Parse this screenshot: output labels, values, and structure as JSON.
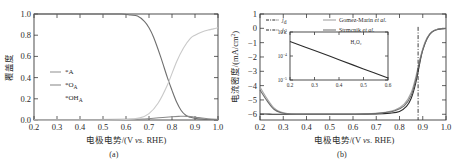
{
  "figure": {
    "panel_a_caption": "(a)",
    "panel_b_caption": "(b)"
  },
  "chart_data": [
    {
      "id": "panel_a",
      "type": "line",
      "title": "",
      "xlabel": "电极电势/(V vs. RHE)",
      "ylabel": "覆盖度",
      "xlim": [
        0.2,
        1.0
      ],
      "ylim": [
        0.0,
        1.0
      ],
      "xticks": [
        "0.2",
        "0.3",
        "0.4",
        "0.5",
        "0.6",
        "0.7",
        "0.8",
        "0.9",
        "1.0"
      ],
      "yticks": [
        "0.0",
        "0.2",
        "0.4",
        "0.6",
        "0.8",
        "1.0"
      ],
      "grid": false,
      "legend_position": "center-left",
      "legend": [
        {
          "label": "*A",
          "color": "#9a9a9a",
          "has_line": true
        },
        {
          "label": "*O",
          "sub": "A",
          "color": "#8e8e8e",
          "has_line": true
        },
        {
          "label": "*OH",
          "sub": "A",
          "color": "#7d7d7d",
          "has_line": false
        }
      ],
      "series": [
        {
          "name": "*OH_A",
          "color": "#6f6f6f",
          "x": [
            0.2,
            0.3,
            0.4,
            0.5,
            0.58,
            0.62,
            0.65,
            0.68,
            0.7,
            0.72,
            0.75,
            0.78,
            0.8,
            0.82,
            0.84,
            0.86,
            0.88,
            0.9,
            0.93,
            0.96,
            1.0
          ],
          "values": [
            1.0,
            1.0,
            1.0,
            1.0,
            1.0,
            0.99,
            0.98,
            0.93,
            0.87,
            0.78,
            0.6,
            0.4,
            0.28,
            0.17,
            0.09,
            0.045,
            0.025,
            0.015,
            0.008,
            0.005,
            0.003
          ]
        },
        {
          "name": "*A",
          "color": "#8a8a8a",
          "x": [
            0.2,
            0.4,
            0.6,
            0.68,
            0.72,
            0.76,
            0.8,
            0.83,
            0.85,
            0.87,
            0.89,
            0.91,
            0.94,
            0.97,
            1.0
          ],
          "values": [
            0.005,
            0.005,
            0.006,
            0.01,
            0.017,
            0.024,
            0.03,
            0.034,
            0.036,
            0.034,
            0.03,
            0.024,
            0.016,
            0.01,
            0.007
          ]
        },
        {
          "name": "*O_A",
          "color": "#c9c9c9",
          "x": [
            0.2,
            0.45,
            0.6,
            0.66,
            0.7,
            0.74,
            0.78,
            0.82,
            0.85,
            0.88,
            0.9,
            0.93,
            0.96,
            0.98,
            1.0
          ],
          "values": [
            0.0,
            0.0,
            0.005,
            0.02,
            0.06,
            0.16,
            0.33,
            0.55,
            0.68,
            0.77,
            0.8,
            0.83,
            0.85,
            0.86,
            0.87
          ]
        }
      ]
    },
    {
      "id": "panel_b",
      "type": "line",
      "title": "",
      "xlabel": "电极电势/(V vs. RHE)",
      "ylabel": "电流密度/(mA/cm²)",
      "xlim": [
        0.2,
        1.0
      ],
      "ylim": [
        -6.4,
        1.0
      ],
      "xticks": [
        "0.2",
        "0.3",
        "0.4",
        "0.5",
        "0.6",
        "0.7",
        "0.8",
        "0.9",
        "1.0"
      ],
      "yticks": [
        "1",
        "0",
        "-1",
        "-2",
        "-3",
        "-4",
        "-5",
        "-6"
      ],
      "grid": false,
      "legend_position": "top-left",
      "legend": [
        {
          "label": "j",
          "sub": "d",
          "style": "dash-dot",
          "color": "#2b2b2b"
        },
        {
          "label": "j",
          "sub": "k",
          "style": "dash-dot",
          "color": "#2b2b2b"
        },
        {
          "label": "Gomez-Marin et al.",
          "style": "solid",
          "color": "#9a9a9a"
        },
        {
          "label": "Strmcnik et al.",
          "style": "solid",
          "color": "#6b6b6b"
        }
      ],
      "annotations": [
        {
          "name": "onset-dashed-line",
          "type": "vline",
          "x": 0.88
        }
      ],
      "series": [
        {
          "name": "j_total_model",
          "color": "#2b2b2b",
          "x": [
            0.2,
            0.24,
            0.27,
            0.3,
            0.34,
            0.4,
            0.5,
            0.6,
            0.7,
            0.76,
            0.8,
            0.83,
            0.85,
            0.87,
            0.89,
            0.9,
            0.92,
            0.94,
            0.96,
            0.98,
            1.0
          ],
          "values": [
            -5.98,
            -5.99,
            -6.0,
            -6.0,
            -6.0,
            -6.0,
            -6.0,
            -6.0,
            -5.98,
            -5.92,
            -5.8,
            -5.45,
            -4.9,
            -3.8,
            -2.2,
            -1.5,
            -0.65,
            -0.25,
            -0.09,
            -0.03,
            -0.01
          ]
        },
        {
          "name": "Gomez-Marin et al.",
          "color": "#a6a6a6",
          "x": [
            0.2,
            0.23,
            0.26,
            0.29,
            0.32,
            0.36,
            0.45,
            0.55,
            0.65,
            0.72,
            0.78,
            0.82,
            0.85,
            0.87,
            0.89,
            0.91,
            0.93,
            0.95,
            0.97,
            1.0
          ],
          "values": [
            -4.1,
            -4.9,
            -5.55,
            -5.85,
            -5.95,
            -5.98,
            -5.98,
            -5.98,
            -5.96,
            -5.9,
            -5.7,
            -5.3,
            -4.5,
            -3.4,
            -2.0,
            -0.95,
            -0.38,
            -0.14,
            -0.05,
            -0.01
          ]
        },
        {
          "name": "Strmcnik et al.",
          "color": "#6b6b6b",
          "x": [
            0.2,
            0.23,
            0.26,
            0.29,
            0.32,
            0.36,
            0.45,
            0.55,
            0.65,
            0.72,
            0.78,
            0.82,
            0.85,
            0.87,
            0.89,
            0.91,
            0.93,
            0.95,
            0.97,
            1.0
          ],
          "values": [
            -4.3,
            -5.05,
            -5.65,
            -5.9,
            -5.97,
            -5.99,
            -5.99,
            -5.99,
            -5.97,
            -5.92,
            -5.76,
            -5.42,
            -4.7,
            -3.6,
            -2.1,
            -1.05,
            -0.42,
            -0.16,
            -0.06,
            -0.01
          ]
        }
      ],
      "inset": {
        "type": "line",
        "xlabel": "",
        "ylabel": "",
        "annotation": "H₂O₂",
        "xlim": [
          0.2,
          0.6
        ],
        "ylim_log": [
          1e-05,
          0.001
        ],
        "xticks": [
          "0.2",
          "0.3",
          "0.4",
          "0.5",
          "0.6"
        ],
        "yticks": [
          "10⁻³",
          "10⁻⁴",
          "10⁻⁵"
        ],
        "series": [
          {
            "name": "H2O2-yield",
            "color": "#2b2b2b",
            "x": [
              0.2,
              0.3,
              0.4,
              0.5,
              0.6
            ],
            "values": [
              0.0004,
              0.00017,
              7e-05,
              2.9e-05,
              1.2e-05
            ]
          }
        ]
      }
    }
  ]
}
